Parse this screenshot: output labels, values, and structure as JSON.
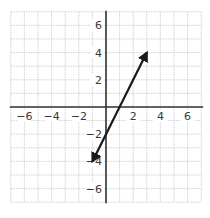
{
  "chart_data": {
    "type": "line",
    "title": "",
    "xlabel": "",
    "ylabel": "",
    "xlim": [
      -7,
      7
    ],
    "ylim": [
      -7,
      7
    ],
    "grid": true,
    "x_ticks": [
      -6,
      -4,
      -2,
      2,
      4,
      6
    ],
    "y_ticks": [
      -6,
      -4,
      -2,
      2,
      4,
      6
    ],
    "x_tick_labels": [
      "−6",
      "−4",
      "−2",
      "2",
      "4",
      "6"
    ],
    "y_tick_labels": [
      "−6",
      "−4",
      "−2",
      "2",
      "4",
      "6"
    ],
    "series": [
      {
        "name": "line",
        "equation": "y = 2x - 2",
        "x": [
          -1,
          3
        ],
        "y": [
          -4,
          4
        ],
        "arrows": "both",
        "color": "#1a1a1a"
      }
    ]
  },
  "colors": {
    "grid": "#c8c8c8",
    "axis": "#333333",
    "line": "#1a1a1a",
    "label": "#3a3a3a"
  }
}
